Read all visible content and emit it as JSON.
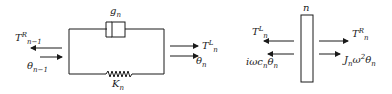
{
  "left_element": {
    "damper_label": {
      "base": "g",
      "sub": "n"
    },
    "spring_label": {
      "base": "K",
      "sub": "n"
    },
    "left_torque": {
      "base": "T",
      "sub": "n−1",
      "sup": "R"
    },
    "left_angle": {
      "base": "θ",
      "sub": "n−1"
    },
    "right_torque": {
      "base": "T",
      "sub": "n",
      "sup": "L"
    },
    "right_angle": {
      "base": "θ",
      "sub": "n"
    }
  },
  "right_element": {
    "disk_label": "n",
    "left_torque": {
      "base": "T",
      "sub": "n",
      "sup": "L"
    },
    "left_damping": {
      "pre": "iωc",
      "sub": "n",
      "base": "θ",
      "sub2": "n"
    },
    "right_torque": {
      "base": "T",
      "sub": "n",
      "sup": "R"
    },
    "right_inertia": {
      "base": "J",
      "sub": "n",
      "mid": "ω",
      "sup": "2",
      "base2": "θ",
      "sub2": "n"
    }
  },
  "colors": {
    "ink": "#1a1a1a",
    "background": "#ffffff"
  }
}
